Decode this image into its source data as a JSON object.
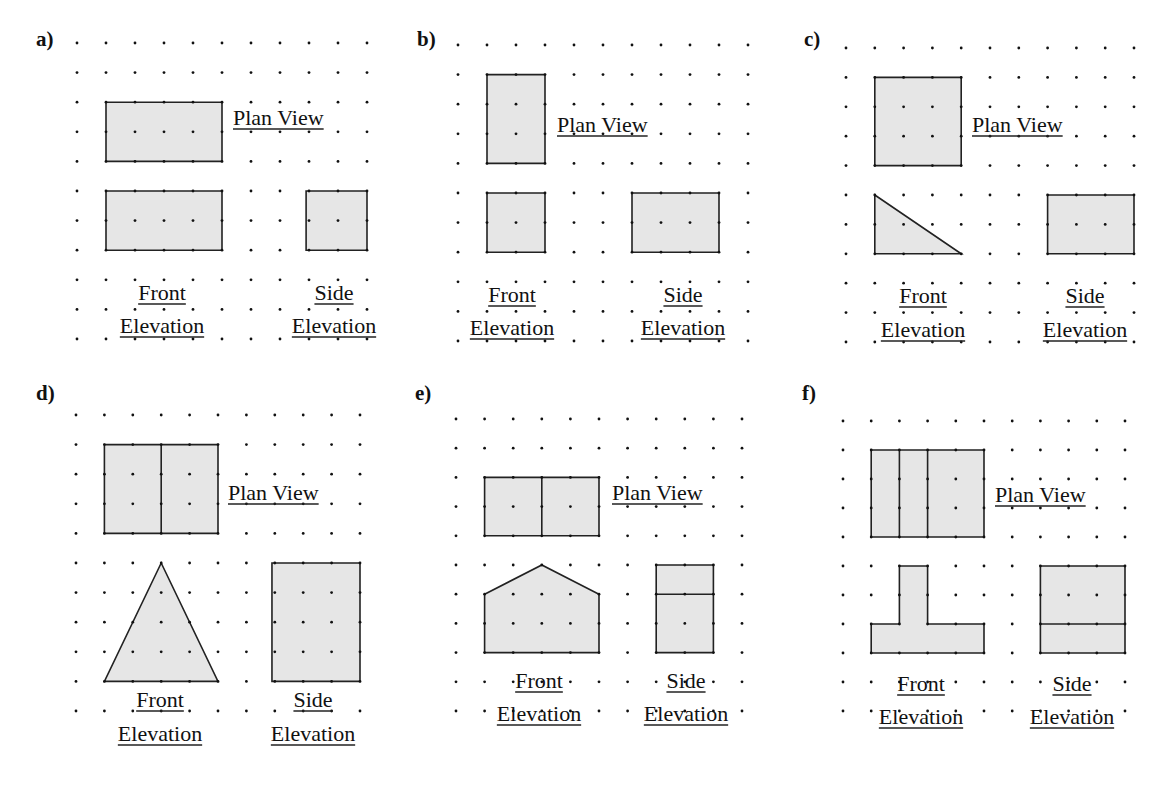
{
  "figure": {
    "colors": {
      "fill": "#e6e6e6",
      "stroke": "#222222",
      "dot": "#111111",
      "background": "#ffffff"
    },
    "grid": {
      "cols": 11,
      "rows": 11
    },
    "panels": [
      {
        "id": "a",
        "label": "a)",
        "label_pos": [
          36,
          46
        ],
        "origin": [
          77,
          43
        ],
        "spacing": [
          29.0,
          29.6
        ],
        "plan": {
          "text": "Plan View",
          "pos": [
            233,
            125
          ],
          "shape": [
            [
              1,
              2
            ],
            [
              5,
              2
            ],
            [
              5,
              4
            ],
            [
              1,
              4
            ]
          ],
          "dividers": []
        },
        "front": {
          "text1": "Front",
          "text2": "Elevation",
          "pos1": [
            162,
            300
          ],
          "pos2": [
            162,
            333
          ],
          "shape": [
            [
              1,
              5
            ],
            [
              5,
              5
            ],
            [
              5,
              7
            ],
            [
              1,
              7
            ]
          ],
          "dividers": []
        },
        "side": {
          "text1": "Side",
          "text2": "Elevation",
          "pos1": [
            334,
            300
          ],
          "pos2": [
            334,
            333
          ],
          "shape": [
            [
              7.9,
              5
            ],
            [
              10,
              5
            ],
            [
              10,
              7
            ],
            [
              7.9,
              7
            ]
          ],
          "dividers": []
        }
      },
      {
        "id": "b",
        "label": "b)",
        "label_pos": [
          417,
          46
        ],
        "origin": [
          458,
          45
        ],
        "spacing": [
          29.0,
          29.6
        ],
        "plan": {
          "text": "Plan View",
          "pos": [
            557,
            132
          ],
          "shape": [
            [
              1,
              1
            ],
            [
              3,
              1
            ],
            [
              3,
              4
            ],
            [
              1,
              4
            ]
          ],
          "dividers": []
        },
        "front": {
          "text1": "Front",
          "text2": "Elevation",
          "pos1": [
            512,
            302
          ],
          "pos2": [
            512,
            335
          ],
          "shape": [
            [
              1,
              5
            ],
            [
              3,
              5
            ],
            [
              3,
              7
            ],
            [
              1,
              7
            ]
          ],
          "dividers": []
        },
        "side": {
          "text1": "Side",
          "text2": "Elevation",
          "pos1": [
            683,
            302
          ],
          "pos2": [
            683,
            335
          ],
          "shape": [
            [
              6,
              5
            ],
            [
              9,
              5
            ],
            [
              9,
              7
            ],
            [
              6,
              7
            ]
          ],
          "dividers": []
        }
      },
      {
        "id": "c",
        "label": "c)",
        "label_pos": [
          804,
          46
        ],
        "origin": [
          846,
          48
        ],
        "spacing": [
          28.8,
          29.4
        ],
        "plan": {
          "text": "Plan View",
          "pos": [
            972,
            132
          ],
          "shape": [
            [
              1,
              1
            ],
            [
              4,
              1
            ],
            [
              4,
              4
            ],
            [
              1,
              4
            ]
          ],
          "dividers": []
        },
        "front": {
          "text1": "Front",
          "text2": "Elevation",
          "pos1": [
            923,
            303
          ],
          "pos2": [
            923,
            337
          ],
          "shape": [
            [
              1,
              5
            ],
            [
              4,
              7
            ],
            [
              1,
              7
            ]
          ],
          "dividers": []
        },
        "side": {
          "text1": "Side",
          "text2": "Elevation",
          "pos1": [
            1085,
            303
          ],
          "pos2": [
            1085,
            337
          ],
          "shape": [
            [
              7,
              5
            ],
            [
              10,
              5
            ],
            [
              10,
              7
            ],
            [
              7,
              7
            ]
          ],
          "dividers": []
        }
      },
      {
        "id": "d",
        "label": "d)",
        "label_pos": [
          36,
          400
        ],
        "origin": [
          76,
          415
        ],
        "spacing": [
          28.4,
          29.6
        ],
        "plan": {
          "text": "Plan View",
          "pos": [
            228,
            500
          ],
          "shape": [
            [
              1,
              1
            ],
            [
              5,
              1
            ],
            [
              5,
              4
            ],
            [
              1,
              4
            ]
          ],
          "dividers": [
            [
              [
                3,
                1
              ],
              [
                3,
                4
              ]
            ]
          ]
        },
        "front": {
          "text1": "Front",
          "text2": "Elevation",
          "pos1": [
            160,
            707
          ],
          "pos2": [
            160,
            741
          ],
          "shape": [
            [
              3,
              5
            ],
            [
              5,
              9
            ],
            [
              1,
              9
            ]
          ],
          "dividers": []
        },
        "side": {
          "text1": "Side",
          "text2": "Elevation",
          "pos1": [
            313,
            707
          ],
          "pos2": [
            313,
            741
          ],
          "shape": [
            [
              6.9,
              5
            ],
            [
              10,
              5
            ],
            [
              10,
              9
            ],
            [
              6.9,
              9
            ]
          ],
          "dividers": []
        }
      },
      {
        "id": "e",
        "label": "e)",
        "label_pos": [
          415,
          400
        ],
        "origin": [
          456,
          419
        ],
        "spacing": [
          28.6,
          29.2
        ],
        "plan": {
          "text": "Plan View",
          "pos": [
            612,
            500
          ],
          "shape": [
            [
              1,
              2
            ],
            [
              5,
              2
            ],
            [
              5,
              4
            ],
            [
              1,
              4
            ]
          ],
          "dividers": [
            [
              [
                3,
                2
              ],
              [
                3,
                4
              ]
            ]
          ]
        },
        "front": {
          "text1": "Front",
          "text2": "Elevation",
          "pos1": [
            539,
            688
          ],
          "pos2": [
            539,
            721
          ],
          "shape": [
            [
              1,
              6
            ],
            [
              3,
              5
            ],
            [
              5,
              6
            ],
            [
              5,
              8
            ],
            [
              1,
              8
            ]
          ],
          "dividers": []
        },
        "side": {
          "text1": "Side",
          "text2": "Elevation",
          "pos1": [
            686,
            688
          ],
          "pos2": [
            686,
            721
          ],
          "shape": [
            [
              7,
              5
            ],
            [
              9,
              5
            ],
            [
              9,
              8
            ],
            [
              7,
              8
            ]
          ],
          "dividers": [
            [
              [
                7,
                6
              ],
              [
                9,
                6
              ]
            ]
          ]
        }
      },
      {
        "id": "f",
        "label": "f)",
        "label_pos": [
          802,
          400
        ],
        "origin": [
          843,
          421
        ],
        "spacing": [
          28.2,
          29.0
        ],
        "plan": {
          "text": "Plan View",
          "pos": [
            995,
            502
          ],
          "shape": [
            [
              1,
              1
            ],
            [
              5,
              1
            ],
            [
              5,
              4
            ],
            [
              1,
              4
            ]
          ],
          "dividers": [
            [
              [
                2,
                1
              ],
              [
                2,
                4
              ]
            ],
            [
              [
                3,
                1
              ],
              [
                3,
                4
              ]
            ]
          ]
        },
        "front": {
          "text1": "Front",
          "text2": "Elevation",
          "pos1": [
            921,
            691
          ],
          "pos2": [
            921,
            724
          ],
          "shape": [
            [
              2,
              5
            ],
            [
              3,
              5
            ],
            [
              3,
              7
            ],
            [
              5,
              7
            ],
            [
              5,
              8
            ],
            [
              1,
              8
            ],
            [
              1,
              7
            ],
            [
              2,
              7
            ]
          ],
          "dividers": []
        },
        "side": {
          "text1": "Side",
          "text2": "Elevation",
          "pos1": [
            1072,
            691
          ],
          "pos2": [
            1072,
            724
          ],
          "shape": [
            [
              7,
              5
            ],
            [
              10,
              5
            ],
            [
              10,
              8
            ],
            [
              7,
              8
            ]
          ],
          "dividers": [
            [
              [
                7,
                7
              ],
              [
                10,
                7
              ]
            ]
          ]
        }
      }
    ]
  }
}
